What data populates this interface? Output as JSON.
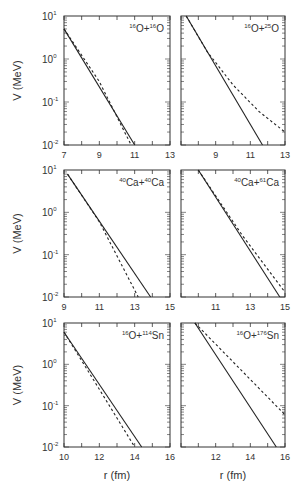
{
  "chart_data": [
    {
      "type": "line",
      "title": "16O+16O",
      "xlabel": "",
      "ylabel": "V (MeV)",
      "xlim": [
        7,
        13
      ],
      "ylim": [
        0.01,
        10
      ],
      "yscale": "log",
      "xticks": [
        "7",
        "9",
        "11",
        "13"
      ],
      "series": [
        {
          "name": "solid",
          "style": "solid",
          "x": [
            7,
            11
          ],
          "y": [
            5,
            0.01
          ]
        },
        {
          "name": "dashed",
          "style": "dashed",
          "x": [
            7,
            9,
            10.8
          ],
          "y": [
            5,
            0.3,
            0.01
          ]
        }
      ]
    },
    {
      "type": "line",
      "title": "16O+25O",
      "xlabel": "",
      "ylabel": "",
      "xlim": [
        7,
        13
      ],
      "ylim": [
        0.01,
        10
      ],
      "yscale": "log",
      "xticks": [
        "9",
        "11",
        "13"
      ],
      "series": [
        {
          "name": "solid",
          "style": "solid",
          "x": [
            7.3,
            11.7
          ],
          "y": [
            10,
            0.01
          ]
        },
        {
          "name": "dashed",
          "style": "dashed",
          "x": [
            7.3,
            8.5,
            10,
            11.5,
            13
          ],
          "y": [
            10,
            1.5,
            0.25,
            0.06,
            0.02
          ]
        }
      ]
    },
    {
      "type": "line",
      "title": "40Ca+40Ca",
      "xlabel": "",
      "ylabel": "V (MeV)",
      "xlim": [
        9,
        15
      ],
      "ylim": [
        0.01,
        10
      ],
      "yscale": "log",
      "xticks": [
        "9",
        "11",
        "13",
        "15"
      ],
      "series": [
        {
          "name": "solid",
          "style": "solid",
          "x": [
            9.2,
            13.9
          ],
          "y": [
            8,
            0.01
          ]
        },
        {
          "name": "dashed",
          "style": "dashed",
          "x": [
            9.2,
            11,
            13.2
          ],
          "y": [
            8,
            0.6,
            0.01
          ]
        }
      ]
    },
    {
      "type": "line",
      "title": "40Ca+61Ca",
      "xlabel": "",
      "ylabel": "",
      "xlim": [
        9,
        15
      ],
      "ylim": [
        0.01,
        10
      ],
      "yscale": "log",
      "xticks": [
        "11",
        "13",
        "15"
      ],
      "series": [
        {
          "name": "solid",
          "style": "solid",
          "x": [
            10,
            14.7
          ],
          "y": [
            10,
            0.01
          ]
        },
        {
          "name": "dashed",
          "style": "dashed",
          "x": [
            10,
            12.5,
            15
          ],
          "y": [
            10,
            0.3,
            0.013
          ]
        }
      ]
    },
    {
      "type": "line",
      "title": "16O+114Sn",
      "xlabel": "r (fm)",
      "ylabel": "V (MeV)",
      "xlim": [
        10,
        16
      ],
      "ylim": [
        0.01,
        10
      ],
      "yscale": "log",
      "xticks": [
        "10",
        "12",
        "14",
        "16"
      ],
      "series": [
        {
          "name": "solid",
          "style": "solid",
          "x": [
            10,
            14.4
          ],
          "y": [
            6,
            0.01
          ]
        },
        {
          "name": "dashed",
          "style": "dashed",
          "x": [
            10,
            12,
            14
          ],
          "y": [
            6,
            0.25,
            0.01
          ]
        }
      ]
    },
    {
      "type": "line",
      "title": "16O+176Sn",
      "xlabel": "r (fm)",
      "ylabel": "",
      "xlim": [
        10,
        16
      ],
      "ylim": [
        0.01,
        10
      ],
      "yscale": "log",
      "xticks": [
        "12",
        "14",
        "16"
      ],
      "series": [
        {
          "name": "solid",
          "style": "solid",
          "x": [
            10.8,
            15.5
          ],
          "y": [
            10,
            0.01
          ]
        },
        {
          "name": "dashed",
          "style": "dashed",
          "x": [
            10.8,
            13.5,
            16
          ],
          "y": [
            10,
            0.7,
            0.06
          ]
        }
      ]
    }
  ],
  "labels": {
    "ylabel": "V (MeV)",
    "xlabel": "r (fm)",
    "yticks": [
      "10",
      "10",
      "10",
      "10"
    ],
    "yexps": [
      "1",
      "0",
      "-1",
      "-2"
    ],
    "panels": [
      {
        "a1": "16",
        "e1": "O",
        "a2": "16",
        "e2": "O"
      },
      {
        "a1": "16",
        "e1": "O",
        "a2": "25",
        "e2": "O"
      },
      {
        "a1": "40",
        "e1": "Ca",
        "a2": "40",
        "e2": "Ca"
      },
      {
        "a1": "40",
        "e1": "Ca",
        "a2": "61",
        "e2": "Ca"
      },
      {
        "a1": "16",
        "e1": "O",
        "a2": "114",
        "e2": "Sn"
      },
      {
        "a1": "16",
        "e1": "O",
        "a2": "176",
        "e2": "Sn"
      }
    ]
  }
}
